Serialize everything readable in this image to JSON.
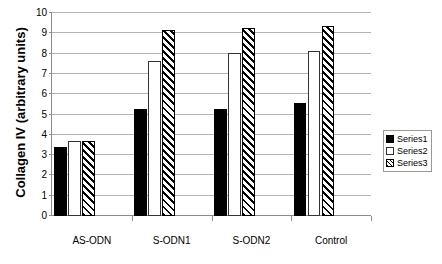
{
  "chart_data": {
    "type": "bar",
    "title": "",
    "xlabel": "",
    "ylabel": "Collagen IV (arbitrary units)",
    "categories": [
      "AS-ODN",
      "S-ODN1",
      "S-ODN2",
      "Control"
    ],
    "series": [
      {
        "name": "Series1",
        "color": "#000000",
        "fill": "solid-black",
        "values": [
          3.4,
          5.25,
          5.25,
          5.55
        ]
      },
      {
        "name": "Series2",
        "color": "#ffffff",
        "fill": "white-outline",
        "values": [
          3.7,
          7.65,
          8.05,
          8.15
        ]
      },
      {
        "name": "Series3",
        "color": "#000000",
        "fill": "diagonal-hatch",
        "values": [
          3.7,
          9.15,
          9.25,
          9.35
        ]
      }
    ],
    "ylim": [
      0,
      10
    ],
    "yticks": [
      0,
      1,
      2,
      3,
      4,
      5,
      6,
      7,
      8,
      9,
      10
    ],
    "ytick_labels": [
      "0",
      "1",
      "2",
      "3",
      "4",
      "5",
      "6",
      "7",
      "8",
      "9",
      "10"
    ],
    "grid": true,
    "grid_axis": "y",
    "legend_position": "right",
    "legend_entries": [
      "Series1",
      "Series2",
      "Series3"
    ],
    "axis_color": "#8c8c8c",
    "gridline_color": "#b3b3b3",
    "background": "#ffffff"
  }
}
